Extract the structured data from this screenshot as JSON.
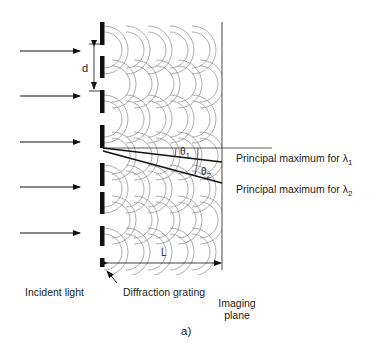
{
  "figure": {
    "panel_label": "a)",
    "labels": {
      "incident_light": "Incident light",
      "diffraction_grating": "Diffraction grating",
      "imaging_plane_line1": "Imaging",
      "imaging_plane_line2": "plane",
      "slit_spacing": "d",
      "distance": "L",
      "theta1": "θ",
      "theta1_sub": "1",
      "theta2": "θ",
      "theta2_sub": "2",
      "max1_text": "Principal maximum for λ",
      "max1_sub": "1",
      "max2_text": "Principal maximum for λ",
      "max2_sub": "2"
    },
    "colors": {
      "ink": "#111111",
      "wave": "#8a8a8a",
      "text": "#222222"
    },
    "grating_bars": [
      [
        22,
        45
      ],
      [
        56,
        78
      ],
      [
        90,
        113
      ],
      [
        125,
        148
      ],
      [
        163,
        186
      ],
      [
        192,
        214
      ],
      [
        226,
        246
      ],
      [
        258,
        267
      ]
    ],
    "incident_arrows_y": [
      51,
      96,
      142,
      187,
      233
    ],
    "slit_centers_y": [
      50,
      84,
      119,
      156,
      189,
      220,
      252
    ]
  }
}
